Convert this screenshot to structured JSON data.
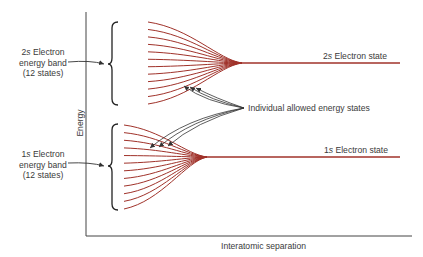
{
  "diagram": {
    "axes": {
      "y_label": "Energy",
      "x_label": "Interatomic separation"
    },
    "bands": [
      {
        "id": "2s",
        "label_line1_prefix": "2",
        "label_line1_italic": "s",
        "label_line1_suffix": " Electron",
        "label_line2": "energy band",
        "label_line3": "(12 states)",
        "state_label_prefix": "2",
        "state_label_italic": "s",
        "state_label_suffix": " Electron state",
        "num_states": 12
      },
      {
        "id": "1s",
        "label_line1_prefix": "1",
        "label_line1_italic": "s",
        "label_line1_suffix": " Electron",
        "label_line2": "energy band",
        "label_line3": "(12 states)",
        "state_label_prefix": "1",
        "state_label_italic": "s",
        "state_label_suffix": " Electron state",
        "num_states": 12
      }
    ],
    "annotation": "Individual allowed energy states",
    "colors": {
      "curve": "#a0322a",
      "axis": "#444444",
      "text": "#3a3a3a",
      "arrow": "#333333"
    }
  }
}
